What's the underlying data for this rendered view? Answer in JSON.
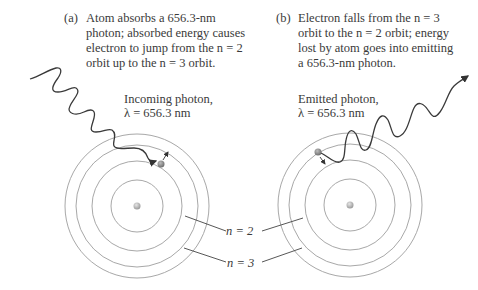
{
  "panels": {
    "a": {
      "tag": "(a)",
      "caption_lines": [
        "Atom absorbs a 656.3-nm",
        "photon; absorbed energy causes",
        "electron to jump from the n = 2",
        "orbit up to the n = 3 orbit."
      ],
      "photon_label_line1": "Incoming photon,",
      "photon_label_line2": "λ = 656.3 nm"
    },
    "b": {
      "tag": "(b)",
      "caption_lines": [
        "Electron falls from the n = 3",
        "orbit to the n = 2 orbit; energy",
        "lost by atom goes into emitting",
        "a 656.3-nm photon."
      ],
      "photon_label_line1": "Emitted photon,",
      "photon_label_line2": "λ = 656.3 nm"
    }
  },
  "orbit_labels": {
    "n2": "n = 2",
    "n3": "n = 3"
  },
  "colors": {
    "orbit": "#a8a8a8",
    "photon": "#3a3a3a",
    "text": "#3a3a3a",
    "nucleus": "#b0b0b0",
    "electron": "#8a8a8a"
  }
}
